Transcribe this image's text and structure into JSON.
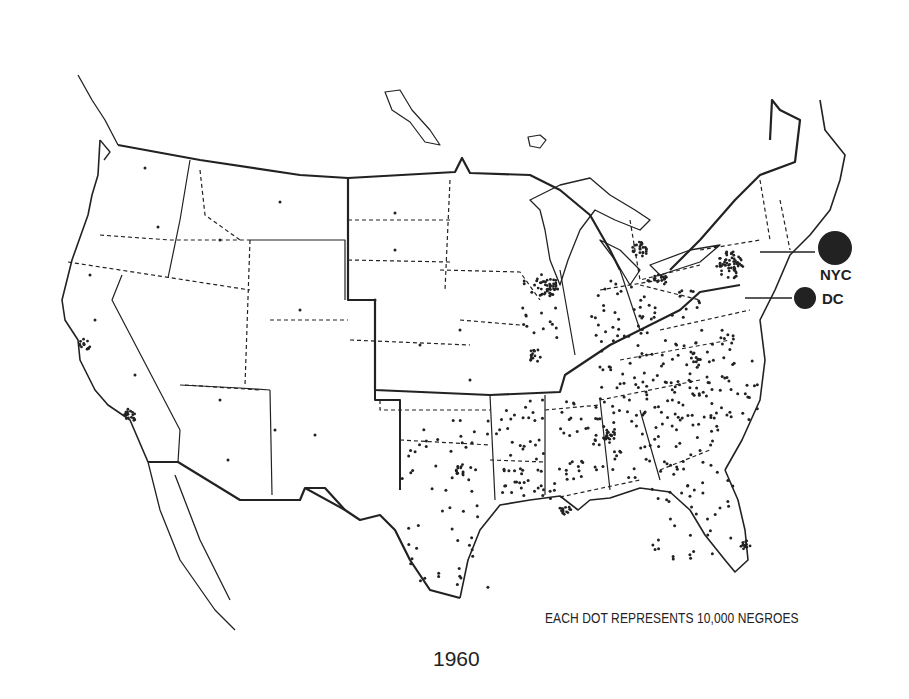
{
  "map": {
    "title": "1960",
    "type": "dot-density",
    "legend": "EACH DOT REPRESENTS 10,000 NEGROES",
    "dot_value": 10000,
    "region": "Contiguous United States",
    "callouts": [
      {
        "label": "NYC"
      },
      {
        "label": "DC"
      }
    ],
    "colors": {
      "ink": "#222222",
      "background": "#ffffff"
    }
  }
}
